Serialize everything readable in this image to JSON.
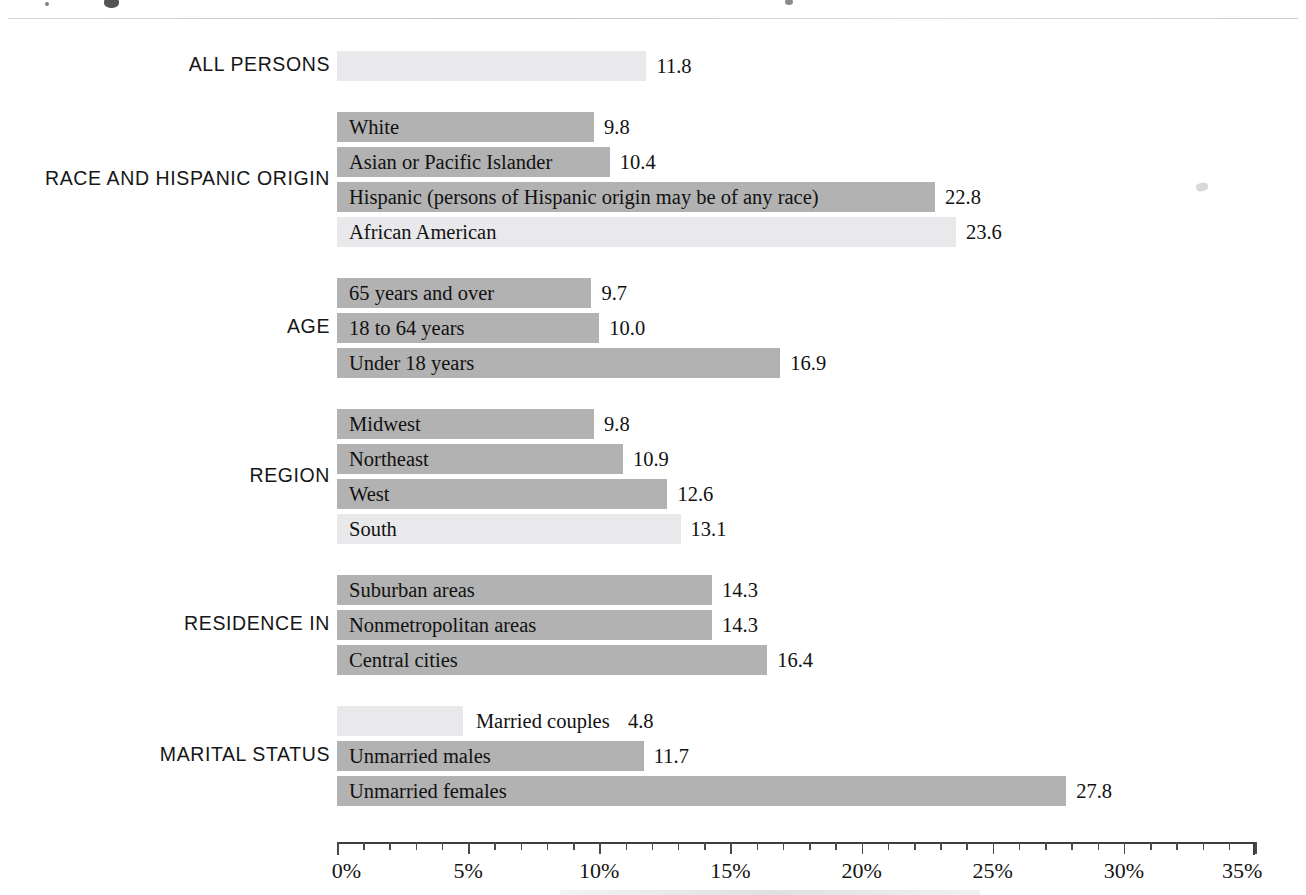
{
  "chart_data": {
    "type": "bar",
    "orientation": "horizontal",
    "title": "",
    "xlabel": "",
    "ylabel": "",
    "xlim": [
      0,
      35
    ],
    "xtick_labels": [
      "0%",
      "5%",
      "10%",
      "15%",
      "20%",
      "25%",
      "30%",
      "35%"
    ],
    "xtick_values": [
      0,
      5,
      10,
      15,
      20,
      25,
      30,
      35
    ],
    "minor_tick_step": 1,
    "grid": false,
    "legend": null,
    "value_suffix": "%",
    "colors": {
      "bar_dark": "#b2b2b2",
      "bar_light": "#e9e9eb",
      "axis": "#3d3d3d",
      "text": "#111111"
    },
    "groups": [
      {
        "label": "ALL PERSONS",
        "bars": [
          {
            "label": "",
            "value": 11.8,
            "value_text": "11.8",
            "shade": "light",
            "label_position": "none"
          }
        ]
      },
      {
        "label": "RACE AND HISPANIC ORIGIN",
        "bars": [
          {
            "label": "White",
            "value": 9.8,
            "value_text": "9.8",
            "shade": "dark",
            "label_position": "inside"
          },
          {
            "label": "Asian or Pacific Islander",
            "value": 10.4,
            "value_text": "10.4",
            "shade": "dark",
            "label_position": "inside"
          },
          {
            "label": "Hispanic (persons of Hispanic origin may be of any race)",
            "value": 22.8,
            "value_text": "22.8",
            "shade": "dark",
            "label_position": "inside"
          },
          {
            "label": "African American",
            "value": 23.6,
            "value_text": "23.6",
            "shade": "light",
            "label_position": "inside"
          }
        ]
      },
      {
        "label": "AGE",
        "bars": [
          {
            "label": "65 years and over",
            "value": 9.7,
            "value_text": "9.7",
            "shade": "dark",
            "label_position": "inside"
          },
          {
            "label": "18 to 64 years",
            "value": 10.0,
            "value_text": "10.0",
            "shade": "dark",
            "label_position": "inside"
          },
          {
            "label": "Under 18 years",
            "value": 16.9,
            "value_text": "16.9",
            "shade": "dark",
            "label_position": "inside"
          }
        ]
      },
      {
        "label": "REGION",
        "bars": [
          {
            "label": "Midwest",
            "value": 9.8,
            "value_text": "9.8",
            "shade": "dark",
            "label_position": "inside"
          },
          {
            "label": "Northeast",
            "value": 10.9,
            "value_text": "10.9",
            "shade": "dark",
            "label_position": "inside"
          },
          {
            "label": "West",
            "value": 12.6,
            "value_text": "12.6",
            "shade": "dark",
            "label_position": "inside"
          },
          {
            "label": "South",
            "value": 13.1,
            "value_text": "13.1",
            "shade": "light",
            "label_position": "inside"
          }
        ]
      },
      {
        "label": "RESIDENCE IN",
        "bars": [
          {
            "label": "Suburban areas",
            "value": 14.3,
            "value_text": "14.3",
            "shade": "dark",
            "label_position": "inside"
          },
          {
            "label": "Nonmetropolitan areas",
            "value": 14.3,
            "value_text": "14.3",
            "shade": "dark",
            "label_position": "inside"
          },
          {
            "label": "Central cities",
            "value": 16.4,
            "value_text": "16.4",
            "shade": "dark",
            "label_position": "inside"
          }
        ]
      },
      {
        "label": "MARITAL STATUS",
        "bars": [
          {
            "label": "Married couples",
            "value": 4.8,
            "value_text": "4.8",
            "shade": "light",
            "label_position": "outside"
          },
          {
            "label": "Unmarried males",
            "value": 11.7,
            "value_text": "11.7",
            "shade": "dark",
            "label_position": "inside"
          },
          {
            "label": "Unmarried females",
            "value": 27.8,
            "value_text": "27.8",
            "shade": "dark",
            "label_position": "inside"
          }
        ]
      }
    ]
  }
}
